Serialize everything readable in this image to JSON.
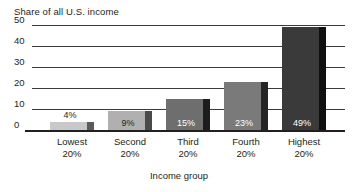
{
  "chart_data": {
    "type": "bar",
    "title": "",
    "ylabel": "Share of all U.S. income",
    "xlabel": "Income group",
    "categories": [
      "Lowest 20%",
      "Second 20%",
      "Third 20%",
      "Fourth 20%",
      "Highest 20%"
    ],
    "category_lines": [
      {
        "line1": "Lowest",
        "line2": "20%"
      },
      {
        "line1": "Second",
        "line2": "20%"
      },
      {
        "line1": "Third",
        "line2": "20%"
      },
      {
        "line1": "Fourth",
        "line2": "20%"
      },
      {
        "line1": "Highest",
        "line2": "20%"
      }
    ],
    "values": [
      4,
      9,
      15,
      23,
      49
    ],
    "data_labels": [
      "4%",
      "9%",
      "15%",
      "23%",
      "49%"
    ],
    "ylim": [
      0,
      50
    ],
    "yticks": [
      50,
      40,
      30,
      20,
      10,
      0
    ],
    "ytick_labels": [
      "50",
      "40",
      "30",
      "20",
      "10",
      "0"
    ],
    "grid": true,
    "legend": "none",
    "bar_colors": [
      "#c9c9c9",
      "#b0b0b0",
      "#6e6e6e",
      "#7a7a7a",
      "#3a3a3a"
    ],
    "bar_shadow_colors": [
      "#5a5a5a",
      "#4a4a4a",
      "#1c1c1c",
      "#242424",
      "#101010"
    ],
    "label_text_colors": [
      "#231f20",
      "#231f20",
      "#ffffff",
      "#ffffff",
      "#ffffff"
    ],
    "label_inside": [
      false,
      true,
      true,
      true,
      true
    ],
    "axis_color": "#231f20",
    "gridline_color": "#3b3b3b",
    "background_color": "#ffffff"
  }
}
